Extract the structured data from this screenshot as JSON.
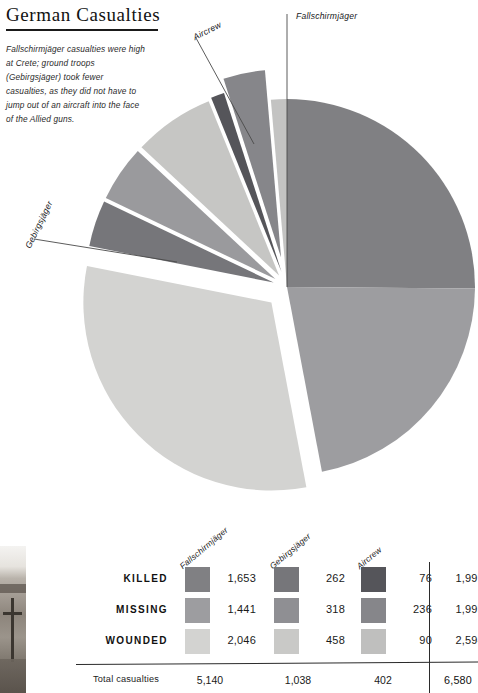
{
  "header": {
    "title": "German Casualties",
    "intro": "Fallschirmjäger casualties were high at Crete; ground troops (Gebirgsjäger) took fewer casualties, as they did not have to jump out of an aircraft into the face of the Allied guns."
  },
  "callouts": {
    "fallschirmjaeger": "Fallschirmjäger",
    "aircrew": "Aircrew",
    "gebirgsjaeger": "Gebirgsjäger"
  },
  "table": {
    "columns": [
      "Fallschirmjäger",
      "Gebirgsjäger",
      "Aircrew"
    ],
    "rows": [
      {
        "label": "KILLED",
        "values": [
          "1,653",
          "262",
          "76"
        ],
        "total": "1,991"
      },
      {
        "label": "MISSING",
        "values": [
          "1,441",
          "318",
          "236"
        ],
        "total": "1,995"
      },
      {
        "label": "WOUNDED",
        "values": [
          "2,046",
          "458",
          "90"
        ],
        "total": "2,594"
      }
    ],
    "total_label": "Total casualties",
    "column_totals": [
      "5,140",
      "1,038",
      "402"
    ],
    "grand_total": "6,580"
  },
  "colors": {
    "fallschirmjaeger_killed": "#808083",
    "fallschirmjaeger_missing": "#9d9da0",
    "fallschirmjaeger_wounded": "#d3d3d1",
    "gebirgsjaeger_killed": "#76767a",
    "gebirgsjaeger_missing": "#8f8f93",
    "gebirgsjaeger_wounded": "#c9c9c7",
    "aircrew_killed": "#55555a",
    "aircrew_missing": "#86868a",
    "aircrew_wounded": "#bfbfbe",
    "rule": "#2b2b2b",
    "text": "#1a1a1a"
  },
  "chart_data": {
    "type": "pie",
    "title": "German Casualties",
    "total": 6580,
    "units": "casualties",
    "start_angle_deg": 0,
    "direction": "clockwise",
    "legend": [
      "Fallschirmjäger",
      "Gebirgsjäger",
      "Aircrew"
    ],
    "categories": [
      "KILLED",
      "MISSING",
      "WOUNDED"
    ],
    "series": [
      {
        "name": "Fallschirmjäger",
        "values": [
          1653,
          1441,
          2046
        ],
        "total": 5140
      },
      {
        "name": "Gebirgsjäger",
        "values": [
          262,
          318,
          458
        ],
        "total": 1038
      },
      {
        "name": "Aircrew",
        "values": [
          76,
          236,
          90
        ],
        "total": 402
      }
    ],
    "category_totals": [
      1991,
      1995,
      2594
    ],
    "slices": [
      {
        "label": "Fallschirmjäger Killed",
        "value": 1653,
        "color": "#808083",
        "exploded": false,
        "explode_px": 0
      },
      {
        "label": "Fallschirmjäger Missing",
        "value": 1441,
        "color": "#9d9da0",
        "exploded": false,
        "explode_px": 0
      },
      {
        "label": "Fallschirmjäger Wounded",
        "value": 2046,
        "color": "#d3d3d1",
        "exploded": true,
        "explode_px": 22
      },
      {
        "label": "Gebirgsjäger Killed",
        "value": 262,
        "color": "#76767a",
        "exploded": true,
        "explode_px": 14
      },
      {
        "label": "Gebirgsjäger Missing",
        "value": 318,
        "color": "#9a9a9d",
        "exploded": true,
        "explode_px": 14
      },
      {
        "label": "Gebirgsjäger Wounded",
        "value": 458,
        "color": "#c6c6c4",
        "exploded": true,
        "explode_px": 14
      },
      {
        "label": "Aircrew Killed",
        "value": 76,
        "color": "#55555a",
        "exploded": true,
        "explode_px": 16
      },
      {
        "label": "Aircrew Missing",
        "value": 236,
        "color": "#86868a",
        "exploded": true,
        "explode_px": 30
      },
      {
        "label": "Aircrew Wounded",
        "value": 90,
        "color": "#c3c3c2",
        "exploded": false,
        "explode_px": 0
      }
    ]
  }
}
